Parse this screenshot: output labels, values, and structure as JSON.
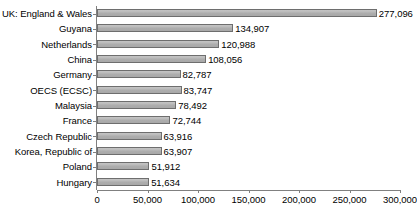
{
  "chart_data": {
    "type": "bar",
    "orientation": "horizontal",
    "title": "",
    "subtitle": "",
    "xlabel": "",
    "ylabel": "",
    "xlim": [
      0,
      300000
    ],
    "xticks": [
      "0",
      "50,000",
      "100,000",
      "150,000",
      "200,000",
      "250,000",
      "300,000"
    ],
    "xtick_values": [
      0,
      50000,
      100000,
      150000,
      200000,
      250000,
      300000
    ],
    "grid": false,
    "legend": false,
    "categories": [
      "UK: England & Wales",
      "Guyana",
      "Netherlands",
      "China",
      "Germany",
      "OECS (ECSC)",
      "Malaysia",
      "France",
      "Czech Republic",
      "Korea, Republic of",
      "Poland",
      "Hungary"
    ],
    "values": [
      277096,
      134907,
      120988,
      108056,
      82787,
      83747,
      78492,
      72744,
      63916,
      63907,
      51912,
      51634
    ],
    "value_labels": [
      "277,096",
      "134,907",
      "120,988",
      "108,056",
      "82,787",
      "83,747",
      "78,492",
      "72,744",
      "63,916",
      "63,907",
      "51,912",
      "51,634"
    ],
    "bar_fill_color": "#b3b3b3",
    "bar_border_color": "#6e6e6e",
    "axis_color": "#808080",
    "background_color": "#ffffff"
  }
}
